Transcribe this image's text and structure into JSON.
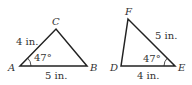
{
  "triangles": [
    {
      "name": "ABC",
      "vertices": {
        "A": "A",
        "B": "B",
        "C": "C"
      },
      "sides": {
        "AC": "4 in.",
        "AB": "5 in."
      },
      "angle": {
        "vertex": "A",
        "value": "47°"
      }
    },
    {
      "name": "DEF",
      "vertices": {
        "D": "D",
        "E": "E",
        "F": "F"
      },
      "sides": {
        "FE": "5 in.",
        "DE": "4 in."
      },
      "angle": {
        "vertex": "E",
        "value": "47°"
      }
    }
  ],
  "colors": {
    "line": "#222222",
    "text": "#333333"
  }
}
